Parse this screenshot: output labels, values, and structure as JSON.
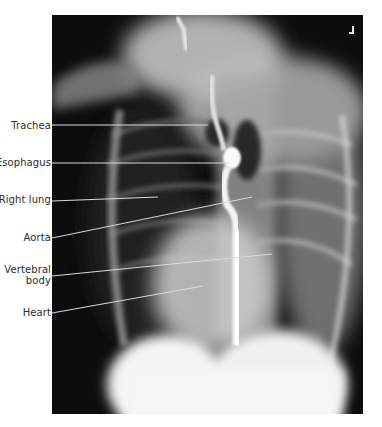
{
  "figure": {
    "type": "barium swallow radiograph",
    "labels": [
      {
        "text": "Trachea",
        "label_y": 126,
        "line": [
          52,
          125,
          208,
          125
        ]
      },
      {
        "text": "Esophagus",
        "label_y": 162,
        "line": [
          52,
          163,
          230,
          163
        ]
      },
      {
        "text": "Right lung",
        "label_y": 199,
        "line": [
          52,
          201,
          158,
          197
        ]
      },
      {
        "text": "Aorta",
        "label_y": 237,
        "line": [
          52,
          238,
          252,
          197
        ]
      },
      {
        "text": "Vertebral body",
        "label_lines": [
          "Vertebral",
          "body"
        ],
        "label_y": 269,
        "line": [
          52,
          276,
          272,
          254
        ]
      },
      {
        "text": "Heart",
        "label_y": 312,
        "line": [
          52,
          313,
          203,
          286
        ]
      }
    ],
    "orientation_marker": "L-shaped corner marker",
    "colors": {
      "background": "#ffffff",
      "film": "#0d0d0d",
      "label_text": "#2b2b2b",
      "leader_line": "#d9d9d9"
    }
  }
}
